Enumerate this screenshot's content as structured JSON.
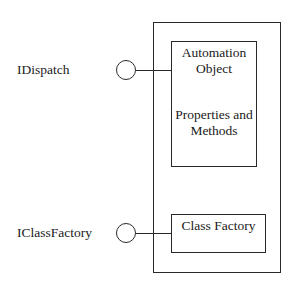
{
  "diagram": {
    "type": "COM automation object component diagram",
    "interfaces": [
      {
        "label": "IDispatch",
        "connects_to": "automation_object"
      },
      {
        "label": "IClassFactory",
        "connects_to": "class_factory"
      }
    ],
    "container": {
      "label": ""
    },
    "automation_object": {
      "title_line1": "Automation",
      "title_line2": "Object",
      "body_line1": "Properties and",
      "body_line2": "Methods"
    },
    "class_factory": {
      "label": "Class Factory"
    },
    "colors": {
      "stroke": "#2a2a2a",
      "background": "#ffffff",
      "text": "#1a1a1a"
    }
  }
}
